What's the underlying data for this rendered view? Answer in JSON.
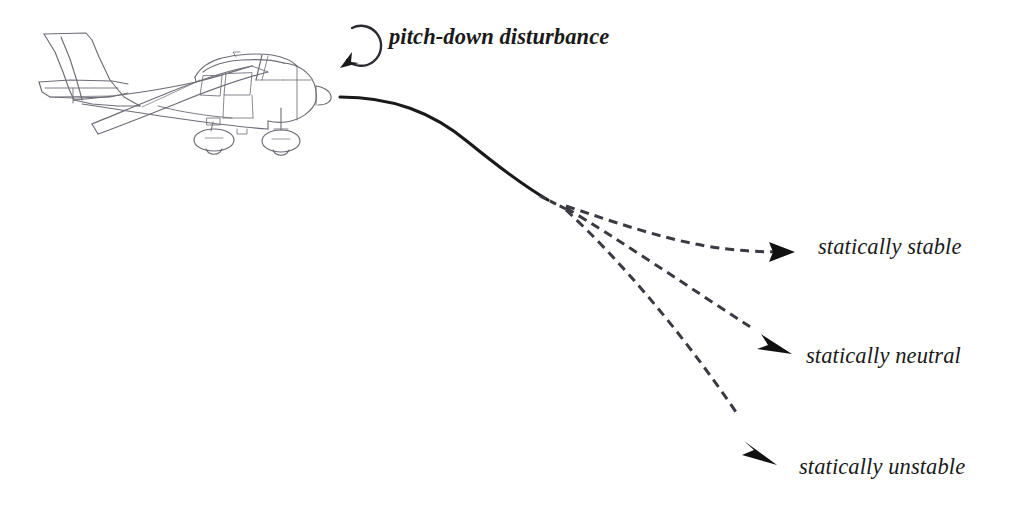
{
  "diagram": {
    "background_color": "#ffffff",
    "ink_color": "#1a1a1a",
    "trajectory_color": "#3a3a42",
    "aircraft": {
      "name": "cessna-high-wing-side-view",
      "description": "Line drawing of a high-wing single-engine light aircraft in side view, facing right",
      "outline_color": "#6d6d78"
    },
    "disturbance": {
      "label": "pitch-down disturbance",
      "icon": "rotation-arrow-counterclockwise-icon"
    },
    "branches": [
      {
        "id": "stable",
        "label": "statically stable",
        "style": "dashed",
        "arrow": "arrowhead-right-icon",
        "description": "Trajectory curves back toward level flight"
      },
      {
        "id": "neutral",
        "label": "statically neutral",
        "style": "dashed",
        "arrow": "arrowhead-down-right-icon",
        "description": "Trajectory continues along a constant descending slope"
      },
      {
        "id": "unstable",
        "label": "statically unstable",
        "style": "dashed",
        "arrow": "arrowhead-steep-down-icon",
        "description": "Trajectory steepens progressively downward"
      }
    ],
    "initial_path": {
      "name": "initial-flight-path",
      "style": "solid",
      "description": "Level flight path from the aircraft that pitches over into a descent"
    }
  }
}
